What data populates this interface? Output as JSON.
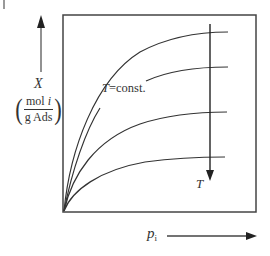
{
  "diagram": {
    "type": "adsorption-isotherms",
    "y_axis": {
      "symbol": "X",
      "unit_numerator": "mol i",
      "unit_numerator_var": "i",
      "unit_numerator_text": "mol ",
      "unit_denominator": "g Ads"
    },
    "x_axis": {
      "symbol": "p",
      "subscript": "i"
    },
    "curve_label": {
      "var": "T",
      "text": "=const."
    },
    "trend_arrow_label": "T",
    "curves": [
      {
        "name": "isotherm-1",
        "end_y_px": 32
      },
      {
        "name": "isotherm-2",
        "end_y_px": 67
      },
      {
        "name": "isotherm-3",
        "end_y_px": 112
      },
      {
        "name": "isotherm-4",
        "end_y_px": 157
      }
    ],
    "colors": {
      "line": "#333333",
      "axis_arrow": "#666666",
      "background": "#ffffff"
    }
  }
}
